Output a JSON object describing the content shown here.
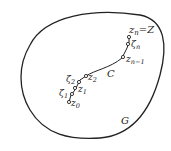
{
  "diagram": {
    "region_label": "G",
    "curve_label": "C",
    "points": [
      {
        "name": "z0",
        "label": "z",
        "sub": "0"
      },
      {
        "name": "zeta1",
        "label": "ζ",
        "sub": "1"
      },
      {
        "name": "z1",
        "label": "z",
        "sub": "1"
      },
      {
        "name": "zeta2",
        "label": "ζ",
        "sub": "2"
      },
      {
        "name": "z2",
        "label": "z",
        "sub": "2"
      },
      {
        "name": "zn-1",
        "label": "z",
        "sub": "n−1"
      },
      {
        "name": "zetan",
        "label": "ζ",
        "sub": "n"
      },
      {
        "name": "zn",
        "label": "z",
        "sub": "n",
        "suffix": "=Z"
      }
    ],
    "colors": {
      "stroke": "#222222",
      "background": "#ffffff"
    }
  }
}
